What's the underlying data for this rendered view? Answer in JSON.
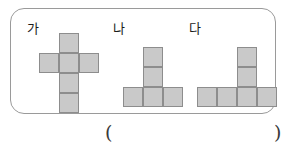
{
  "figure_box": {
    "border_color": "#9a9a9a",
    "background": "#ffffff"
  },
  "cell_style": {
    "fill": "#c9c9c9",
    "stroke": "#8d8d8d",
    "size_px": 20
  },
  "shapes": [
    {
      "label": "가",
      "name": "shape-ga",
      "description": "plus/cross shaped net of six squares",
      "cell_count": 6,
      "cells": [
        {
          "col": 1,
          "row": 0
        },
        {
          "col": 0,
          "row": 1
        },
        {
          "col": 1,
          "row": 1
        },
        {
          "col": 2,
          "row": 1
        },
        {
          "col": 1,
          "row": 2
        },
        {
          "col": 1,
          "row": 3
        }
      ]
    },
    {
      "label": "나",
      "name": "shape-na",
      "description": "T shaped net of five squares",
      "cell_count": 5,
      "cells": [
        {
          "col": 1,
          "row": 0
        },
        {
          "col": 1,
          "row": 1
        },
        {
          "col": 0,
          "row": 2
        },
        {
          "col": 1,
          "row": 2
        },
        {
          "col": 2,
          "row": 2
        }
      ]
    },
    {
      "label": "다",
      "name": "shape-da",
      "description": "T shaped net of six squares with base row of four",
      "cell_count": 6,
      "cells": [
        {
          "col": 2,
          "row": 0
        },
        {
          "col": 2,
          "row": 1
        },
        {
          "col": 0,
          "row": 2
        },
        {
          "col": 1,
          "row": 2
        },
        {
          "col": 2,
          "row": 2
        },
        {
          "col": 3,
          "row": 2
        }
      ]
    }
  ],
  "answer": {
    "open_paren": "(",
    "close_paren": ")",
    "value": ""
  }
}
